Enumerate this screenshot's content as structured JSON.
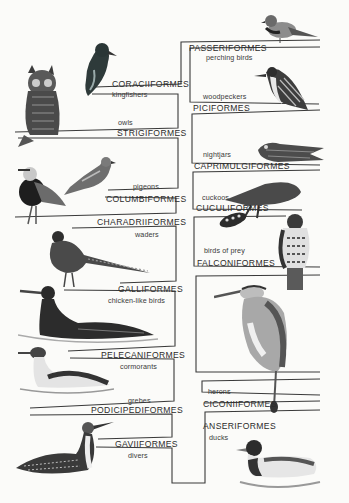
{
  "diagram": {
    "type": "cladogram",
    "left_column": [
      {
        "order": "CORACIIFORMES",
        "common": "kingfishers"
      },
      {
        "order": "STRIGIFORMES",
        "common": "owls"
      },
      {
        "order": "COLUMBIFORMES",
        "common": "pigeons"
      },
      {
        "order": "CHARADRIIFORMES",
        "common": "waders"
      },
      {
        "order": "GALLIFORMES",
        "common": "chicken-like birds"
      },
      {
        "order": "PELECANIFORMES",
        "common": "cormorants"
      },
      {
        "order": "PODICIPEDIFORMES",
        "common": "grebes"
      },
      {
        "order": "GAVIIFORMES",
        "common": "divers"
      }
    ],
    "right_column": [
      {
        "order": "PASSERIFORMES",
        "common": "perching birds"
      },
      {
        "order": "PICIFORMES",
        "common": "woodpeckers"
      },
      {
        "order": "CAPRIMULGIFORMES",
        "common": "nightjars"
      },
      {
        "order": "CUCULIFORMES",
        "common": "cuckoos"
      },
      {
        "order": "FALCONIFORMES",
        "common": "birds of prey"
      },
      {
        "order": "CICONIIFORMES",
        "common": "herons"
      },
      {
        "order": "ANSERIFORMES",
        "common": "ducks"
      }
    ],
    "birds": [
      {
        "name": "sparrow-illustration"
      },
      {
        "name": "kingfisher-illustration"
      },
      {
        "name": "owl-illustration"
      },
      {
        "name": "woodpecker-illustration"
      },
      {
        "name": "nightjar-illustration"
      },
      {
        "name": "lapwing-illustration"
      },
      {
        "name": "pigeon-illustration"
      },
      {
        "name": "cuckoo-illustration"
      },
      {
        "name": "hawk-illustration"
      },
      {
        "name": "pheasant-illustration"
      },
      {
        "name": "heron-illustration"
      },
      {
        "name": "cormorant-illustration"
      },
      {
        "name": "grebe-illustration"
      },
      {
        "name": "diver-illustration"
      },
      {
        "name": "duck-illustration"
      }
    ],
    "colors": {
      "line": "#3a3a3a",
      "background": "#fbfbf9",
      "ink": "#2b2b2b"
    }
  }
}
